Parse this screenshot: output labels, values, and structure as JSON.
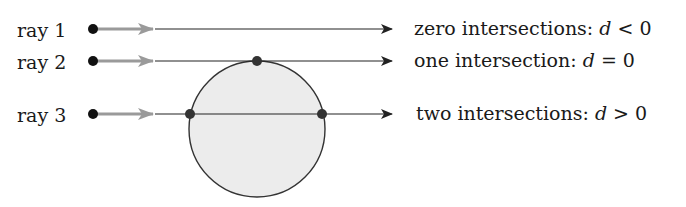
{
  "rays": [
    {
      "id": "ray-1",
      "label": "ray 1",
      "y": 29,
      "result_text": "zero intersections: ",
      "var": "d",
      "relation": " < 0",
      "intersections": []
    },
    {
      "id": "ray-2",
      "label": "ray 2",
      "y": 61,
      "result_text": "one intersection: ",
      "var": "d",
      "relation": " = 0",
      "intersections": [
        257
      ]
    },
    {
      "id": "ray-3",
      "label": "ray 3",
      "y": 114,
      "result_text": "two intersections: ",
      "var": "d",
      "relation": " > 0",
      "intersections": [
        190,
        322
      ]
    }
  ],
  "sphere": {
    "cx": 257,
    "cy": 129,
    "r": 68,
    "fill": "#ececec",
    "stroke": "#333333"
  },
  "colors": {
    "line": "#222222",
    "direction_arrow": "#9a9a9a",
    "point": "#111111",
    "intersection_point": "#333333"
  }
}
